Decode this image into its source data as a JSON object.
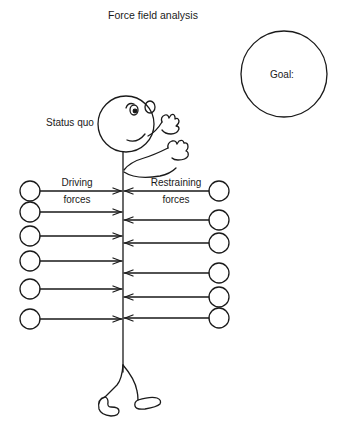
{
  "title": "Force field analysis",
  "goal": {
    "label": "Goal:"
  },
  "figure": {
    "label": "Status quo"
  },
  "driving": {
    "label_line1": "Driving",
    "label_line2": "forces",
    "arrow_count": 6,
    "arrow_y": [
      191,
      212,
      236,
      261,
      289,
      319
    ]
  },
  "restraining": {
    "label_line1": "Restraining",
    "label_line2": "forces",
    "arrow_count": 6,
    "arrow_y": [
      191,
      220,
      243,
      273,
      297,
      318
    ]
  },
  "colors": {
    "stroke": "#1a1a1a",
    "background": "#ffffff"
  }
}
